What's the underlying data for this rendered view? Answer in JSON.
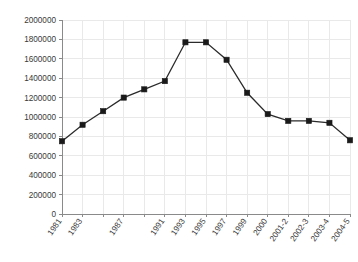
{
  "chart_data": {
    "type": "line",
    "title": "",
    "subtitle": "",
    "xlabel": "",
    "ylabel": "",
    "ylim": [
      0,
      2000000
    ],
    "ytick_values": [
      0,
      200000,
      400000,
      600000,
      800000,
      1000000,
      1200000,
      1400000,
      1600000,
      1800000,
      2000000
    ],
    "ytick_labels": [
      "0",
      "200000",
      "400000",
      "600000",
      "800000",
      "1000000",
      "1200000",
      "1400000",
      "1600000",
      "1800000",
      "2000000"
    ],
    "grid": true,
    "legend": "none",
    "categories": [
      "1981",
      "1983",
      "1985",
      "1987",
      "1989",
      "1991",
      "1993",
      "1995",
      "1997",
      "1999",
      "2000",
      "2001-2",
      "2002-3",
      "2003-4",
      "2004-5"
    ],
    "xtick_labels_shown": [
      "1981",
      "1983",
      "1987",
      "1991",
      "1993",
      "1995",
      "1997",
      "1999",
      "2000",
      "2001-2",
      "2002-3",
      "2003-4",
      "2004-5"
    ],
    "series": [
      {
        "name": "series-1",
        "values": [
          750000,
          920000,
          1060000,
          1200000,
          1285000,
          1370000,
          1770000,
          1770000,
          1590000,
          1250000,
          1030000,
          960000,
          960000,
          940000,
          760000
        ]
      }
    ],
    "colors": {
      "line": "#2b2b2b",
      "marker": "#1a1a1a",
      "grid": "#e9e9e9",
      "axis": "#8a8a8a",
      "tick_text": "#3a3a3a",
      "background": "#ffffff"
    }
  }
}
